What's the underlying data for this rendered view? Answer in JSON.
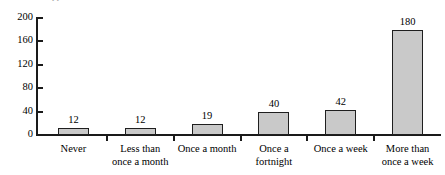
{
  "caption": {
    "clipped_text": "clipped text above chart"
  },
  "chart_data": {
    "type": "bar",
    "title": "",
    "xlabel": "",
    "ylabel": "",
    "ylim": [
      0,
      200
    ],
    "yticks": [
      0,
      40,
      80,
      120,
      160,
      200
    ],
    "grid": false,
    "legend": null,
    "categories": [
      "Never",
      "Less than\nonce a month",
      "Once a month",
      "Once a\nfortnight",
      "Once a week",
      "More than\nonce a week"
    ],
    "values": [
      12,
      12,
      19,
      40,
      42,
      180
    ],
    "value_labels": [
      "12",
      "12",
      "19",
      "40",
      "42",
      "180"
    ],
    "bar_fill": "#c9c9c9",
    "bar_edge": "#1f1f1f",
    "axis_color": "#1a1a1a"
  }
}
